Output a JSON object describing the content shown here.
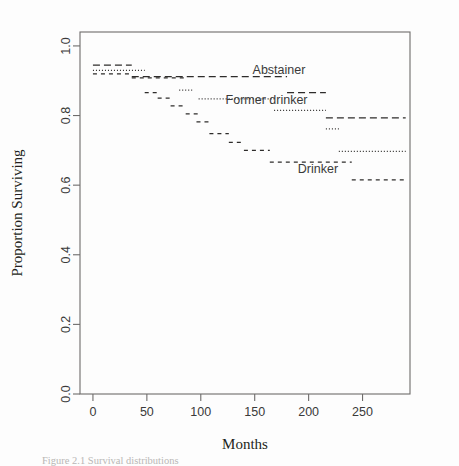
{
  "figure": {
    "title": "",
    "caption": "Figure 2.1  Survival distributions",
    "background_color": "#fdfdfd",
    "frame_color": "#6e6c6b",
    "line_color": "#2e2c2b"
  },
  "axes": {
    "xlabel": "Months",
    "ylabel": "Proportion Surviving",
    "x_ticks": [
      "0",
      "50",
      "100",
      "150",
      "200",
      "250"
    ],
    "x_tick_values": [
      0,
      50,
      100,
      150,
      200,
      250
    ],
    "y_ticks": [
      "0.0",
      "0.2",
      "0.4",
      "0.6",
      "0.8",
      "1.0"
    ],
    "y_tick_values": [
      0.0,
      0.2,
      0.4,
      0.6,
      0.8,
      1.0
    ],
    "xlim": [
      -12,
      294
    ],
    "ylim": [
      0.0,
      1.04
    ],
    "grid": false
  },
  "annotations": [
    {
      "id": "abstainer-label",
      "text": "Abstainer",
      "x": 148,
      "y": 0.932
    },
    {
      "id": "former-drinker-label",
      "text": "Former drinker",
      "x": 123,
      "y": 0.846
    },
    {
      "id": "drinker-label",
      "text": "Drinker",
      "x": 190,
      "y": 0.645
    }
  ],
  "chart_data": {
    "type": "line",
    "subtype": "kaplan-meier-step",
    "title": "",
    "xlabel": "Months",
    "ylabel": "Proportion Surviving",
    "xlim": [
      -12,
      294
    ],
    "ylim": [
      0.0,
      1.04
    ],
    "grid": false,
    "legend_position": "inline-annotations",
    "series": [
      {
        "name": "Abstainer",
        "linestyle": "longdash",
        "dasharray": "7,4",
        "x": [
          0,
          36,
          180,
          216,
          290
        ],
        "y": [
          0.945,
          0.912,
          0.912,
          0.866,
          0.866
        ],
        "steps": [
          {
            "x_start": 0,
            "x_end": 36,
            "y": 0.945
          },
          {
            "x_start": 36,
            "x_end": 180,
            "y": 0.912
          },
          {
            "x_start": 180,
            "x_end": 216,
            "y": 0.866
          },
          {
            "x_start": 216,
            "x_end": 290,
            "y": 0.793
          }
        ]
      },
      {
        "name": "Former drinker",
        "linestyle": "dotted",
        "dasharray": "1,2",
        "x": [
          0,
          48,
          84,
          98,
          168,
          216,
          228,
          290
        ],
        "y": [
          0.93,
          0.93,
          0.873,
          0.848,
          0.848,
          0.815,
          0.762,
          0.697
        ],
        "steps": [
          {
            "x_start": 0,
            "x_end": 48,
            "y": 0.93
          },
          {
            "x_start": 80,
            "x_end": 92,
            "y": 0.873
          },
          {
            "x_start": 98,
            "x_end": 168,
            "y": 0.848
          },
          {
            "x_start": 168,
            "x_end": 216,
            "y": 0.815
          },
          {
            "x_start": 216,
            "x_end": 228,
            "y": 0.762
          },
          {
            "x_start": 228,
            "x_end": 290,
            "y": 0.697
          }
        ]
      },
      {
        "name": "Drinker",
        "linestyle": "dashed",
        "dasharray": "4,4",
        "x": [
          0,
          36,
          48,
          60,
          72,
          84,
          96,
          108,
          120,
          132,
          144,
          168,
          240,
          290
        ],
        "y": [
          0.92,
          0.908,
          0.866,
          0.85,
          0.828,
          0.805,
          0.782,
          0.748,
          0.723,
          0.7,
          0.666,
          0.666,
          0.615,
          0.615
        ],
        "steps": [
          {
            "x_start": 0,
            "x_end": 36,
            "y": 0.92
          },
          {
            "x_start": 36,
            "x_end": 86,
            "y": 0.908
          },
          {
            "x_start": 48,
            "x_end": 60,
            "y": 0.866
          },
          {
            "x_start": 60,
            "x_end": 74,
            "y": 0.85
          },
          {
            "x_start": 72,
            "x_end": 86,
            "y": 0.828
          },
          {
            "x_start": 86,
            "x_end": 100,
            "y": 0.805
          },
          {
            "x_start": 96,
            "x_end": 110,
            "y": 0.782
          },
          {
            "x_start": 108,
            "x_end": 126,
            "y": 0.748
          },
          {
            "x_start": 126,
            "x_end": 140,
            "y": 0.723
          },
          {
            "x_start": 140,
            "x_end": 164,
            "y": 0.7
          },
          {
            "x_start": 164,
            "x_end": 240,
            "y": 0.666
          },
          {
            "x_start": 240,
            "x_end": 290,
            "y": 0.615
          }
        ]
      }
    ]
  }
}
